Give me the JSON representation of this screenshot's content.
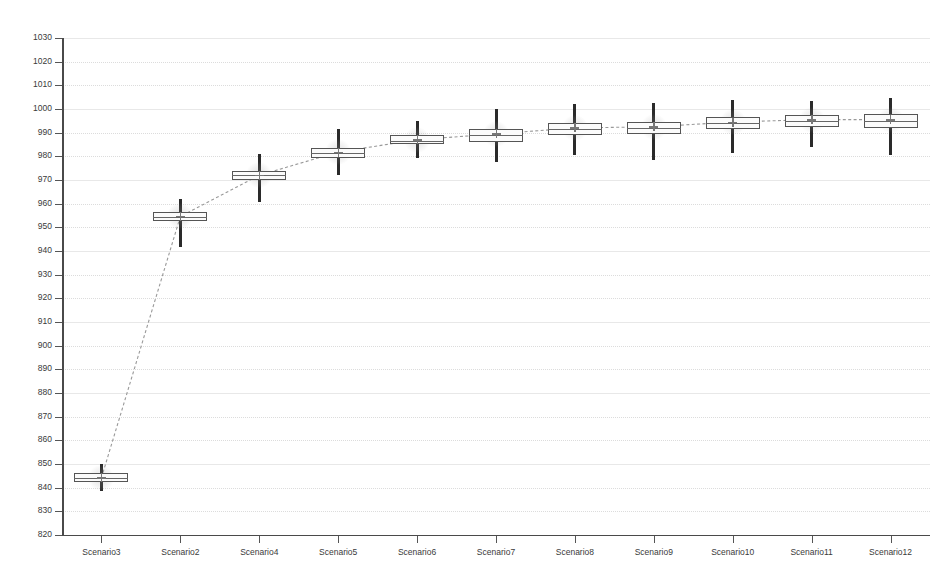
{
  "chart_data": {
    "type": "box",
    "title": "",
    "subtitle": "",
    "xlabel": "",
    "ylabel": "",
    "ylim": [
      820,
      1030
    ],
    "ytick_step": 10,
    "grid": true,
    "legend": "none",
    "categories": [
      "Scenario3",
      "Scenario2",
      "Scenario4",
      "Scenario5",
      "Scenario6",
      "Scenario7",
      "Scenario8",
      "Scenario9",
      "Scenario10",
      "Scenario11",
      "Scenario12"
    ],
    "ytick_labels": [
      "1030",
      "1020",
      "1010",
      "1000",
      "990",
      "980",
      "970",
      "960",
      "950",
      "940",
      "930",
      "920",
      "910",
      "900",
      "890",
      "880",
      "870",
      "860",
      "850",
      "840",
      "830",
      "820"
    ],
    "boxes": [
      {
        "category": "Scenario3",
        "min": 838.5,
        "q1": 842.2,
        "median": 844.0,
        "mean": 844.2,
        "q3": 846.0,
        "max": 850.0
      },
      {
        "category": "Scenario2",
        "min": 941.5,
        "q1": 952.5,
        "median": 954.5,
        "mean": 954.6,
        "q3": 956.5,
        "max": 962.0
      },
      {
        "category": "Scenario4",
        "min": 960.5,
        "q1": 970.0,
        "median": 972.0,
        "mean": 972.0,
        "q3": 974.0,
        "max": 981.0
      },
      {
        "category": "Scenario5",
        "min": 972.0,
        "q1": 979.5,
        "median": 981.5,
        "mean": 981.8,
        "q3": 983.5,
        "max": 991.5
      },
      {
        "category": "Scenario6",
        "min": 979.5,
        "q1": 985.0,
        "median": 986.5,
        "mean": 987.0,
        "q3": 989.0,
        "max": 995.0
      },
      {
        "category": "Scenario7",
        "min": 977.5,
        "q1": 986.0,
        "median": 989.0,
        "mean": 989.5,
        "q3": 991.5,
        "max": 1000.0
      },
      {
        "category": "Scenario8",
        "min": 980.5,
        "q1": 989.0,
        "median": 991.5,
        "mean": 992.0,
        "q3": 994.0,
        "max": 1002.0
      },
      {
        "category": "Scenario9",
        "min": 978.5,
        "q1": 989.5,
        "median": 992.0,
        "mean": 992.5,
        "q3": 994.5,
        "max": 1002.5
      },
      {
        "category": "Scenario10",
        "min": 981.5,
        "q1": 991.5,
        "median": 994.0,
        "mean": 994.5,
        "q3": 996.5,
        "max": 1004.0
      },
      {
        "category": "Scenario11",
        "min": 984.0,
        "q1": 992.5,
        "median": 995.0,
        "mean": 995.5,
        "q3": 997.5,
        "max": 1003.5
      },
      {
        "category": "Scenario12",
        "min": 980.5,
        "q1": 992.0,
        "median": 995.0,
        "mean": 995.5,
        "q3": 998.0,
        "max": 1004.5
      }
    ],
    "mean_trend_series": {
      "name": "mean",
      "style": "dashed",
      "values": [
        844.2,
        954.6,
        972.0,
        981.8,
        987.0,
        989.5,
        992.0,
        992.5,
        994.5,
        995.5,
        995.5
      ]
    },
    "colors": {
      "box_stroke": "#555555",
      "box_fill": "#fbfbfb",
      "whisker": "#2a2a2a",
      "mean_marker": "#777777",
      "trend_line": "#999999",
      "grid": "#dcdcdc",
      "axis": "#4a4a4a",
      "text": "#3a3a3a",
      "background": "#ffffff"
    }
  }
}
